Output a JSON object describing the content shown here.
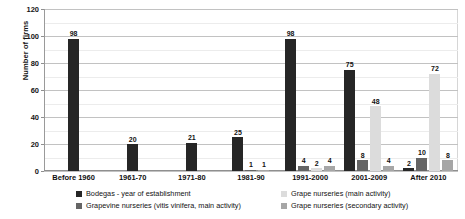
{
  "chart_data": {
    "type": "bar",
    "title": "",
    "xlabel": "",
    "ylabel": "Number of firms",
    "ylim": [
      0,
      120
    ],
    "ytick_step": 20,
    "minor_gridline_step": 10,
    "grid": true,
    "legend_position": "bottom",
    "categories": [
      "Before 1960",
      "1961-70",
      "1971-80",
      "1981-90",
      "1991-2000",
      "2001-2009",
      "After 2010"
    ],
    "yticks": [
      "0",
      "20",
      "40",
      "60",
      "80",
      "100",
      "120"
    ],
    "series": [
      {
        "name": "Bodegas - year of establishment",
        "color": "#262626",
        "values": [
          98,
          20,
          21,
          25,
          98,
          75,
          2
        ]
      },
      {
        "name": "Grapevine nurseries (vitis vinifera, main activity)",
        "color": "#656565",
        "values": [
          null,
          null,
          null,
          1,
          4,
          8,
          10
        ]
      },
      {
        "name": "Grape nurseries (main activity)",
        "color": "#dcdcdc",
        "values": [
          null,
          null,
          null,
          null,
          2,
          48,
          72
        ]
      },
      {
        "name": "Grape nurseries (secondary activity)",
        "color": "#a6a6a6",
        "values": [
          null,
          null,
          null,
          1,
          4,
          4,
          8
        ]
      }
    ]
  }
}
